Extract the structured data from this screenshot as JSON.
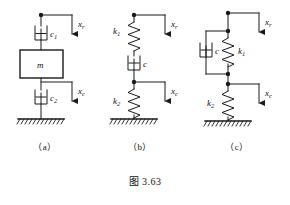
{
  "figure": {
    "caption": "图 3.63",
    "panels": [
      {
        "id": "a",
        "caption": "（a）",
        "elements": {
          "damper_top": "c₁",
          "mass": "m",
          "damper_bottom": "c₂",
          "input_arrow": "x",
          "input_arrow_sub": "r",
          "output_arrow": "x",
          "output_arrow_sub": "c"
        }
      },
      {
        "id": "b",
        "caption": "（b）",
        "elements": {
          "spring_top": "k₁",
          "damper_mid": "c",
          "spring_bottom": "k₂",
          "input_arrow": "x",
          "input_arrow_sub": "r",
          "output_arrow": "x",
          "output_arrow_sub": "c"
        }
      },
      {
        "id": "c",
        "caption": "（c）",
        "elements": {
          "damper_parallel": "c",
          "spring_parallel": "k₁",
          "spring_bottom": "k₂",
          "input_arrow": "x",
          "input_arrow_sub": "r",
          "output_arrow": "x",
          "output_arrow_sub": "c"
        }
      }
    ],
    "labels": {
      "a_c1": "c",
      "a_c1_sub": "1",
      "a_m": "m",
      "a_c2": "c",
      "a_c2_sub": "2",
      "a_xr": "x",
      "a_xr_sub": "r",
      "a_xc": "x",
      "a_xc_sub": "c",
      "b_k1": "k",
      "b_k1_sub": "1",
      "b_c": "c",
      "b_k2": "k",
      "b_k2_sub": "2",
      "b_xr": "x",
      "b_xr_sub": "r",
      "b_xc": "x",
      "b_xc_sub": "c",
      "c_c": "c",
      "c_k1": "k",
      "c_k1_sub": "1",
      "c_k2": "k",
      "c_k2_sub": "2",
      "c_xr": "x",
      "c_xr_sub": "r",
      "c_xc": "x",
      "c_xc_sub": "c"
    },
    "colors": {
      "line": "#1a1a1a",
      "background": "#ffffff",
      "text": "#111111"
    }
  }
}
